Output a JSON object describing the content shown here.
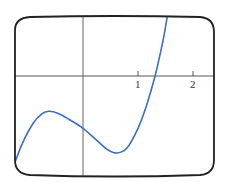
{
  "chart_data": {
    "type": "line",
    "title": "",
    "xlabel": "",
    "ylabel": "",
    "xlim": [
      -1.24,
      2.38
    ],
    "ylim": [
      -1.8,
      1.07
    ],
    "grid": false,
    "legend": null,
    "frame": "rounded-screen",
    "axes": {
      "x_axis_visible": true,
      "y_axis_visible": true
    },
    "x_ticks": [
      {
        "value": 1,
        "label": "1"
      },
      {
        "value": 2,
        "label": "2"
      }
    ],
    "series": [
      {
        "name": "f(x)",
        "color": "#3a6fc9",
        "x": [
          -1.24,
          -1.1,
          -0.9,
          -0.75,
          -0.62,
          -0.45,
          -0.25,
          0.0,
          0.25,
          0.45,
          0.62,
          0.8,
          1.0,
          1.15,
          1.31,
          1.45,
          1.53
        ],
        "y": [
          -1.58,
          -1.22,
          -0.85,
          -0.69,
          -0.64,
          -0.68,
          -0.79,
          -0.95,
          -1.17,
          -1.34,
          -1.4,
          -1.31,
          -0.95,
          -0.55,
          0.0,
          0.62,
          1.07
        ]
      }
    ],
    "features": {
      "local_max": {
        "x": -0.62,
        "y": -0.64
      },
      "local_min": {
        "x": 0.62,
        "y": -1.4
      },
      "y_intercept": -0.95,
      "x_intercept": 1.31
    }
  },
  "labels": {
    "tick1": "1",
    "tick2": "2"
  },
  "colors": {
    "curve": "#3a6fc9",
    "axis": "#555555",
    "frame": "#222222"
  }
}
